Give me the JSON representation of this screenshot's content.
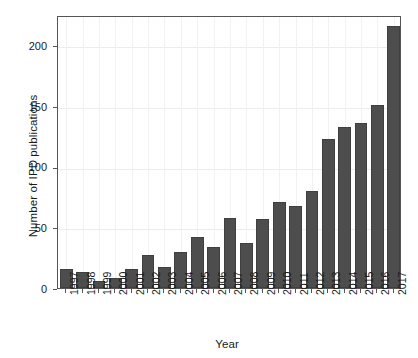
{
  "chart_data": {
    "type": "bar",
    "title": "",
    "xlabel": "Year",
    "ylabel": "Number of IPD publications",
    "categories": [
      "1997",
      "1998",
      "1999",
      "2000",
      "2001",
      "2002",
      "2003",
      "2004",
      "2005",
      "2006",
      "2007",
      "2008",
      "2009",
      "2010",
      "2011",
      "2012",
      "2013",
      "2014",
      "2015",
      "2016",
      "2017"
    ],
    "values": [
      16,
      13,
      6,
      8,
      16,
      27,
      17,
      30,
      42,
      34,
      58,
      37,
      57,
      71,
      68,
      80,
      123,
      133,
      136,
      151,
      216
    ],
    "ylim": [
      0,
      225
    ],
    "yticks": [
      0,
      50,
      100,
      150,
      200
    ],
    "ytick_labels": [
      "0",
      "50",
      "100",
      "150",
      "200"
    ],
    "grid": true,
    "legend": "none",
    "bar_color": "#4d4d4d",
    "grid_color": "#ececec",
    "axis_color": "#555555",
    "background": "#ffffff"
  }
}
